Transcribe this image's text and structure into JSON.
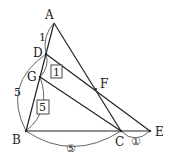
{
  "diagram": {
    "points": [
      {
        "name": "A",
        "x": 54,
        "y": 23
      },
      {
        "name": "D",
        "x": 46,
        "y": 54
      },
      {
        "name": "G",
        "x": 40,
        "y": 77
      },
      {
        "name": "B",
        "x": 26,
        "y": 131
      },
      {
        "name": "C",
        "x": 121,
        "y": 131
      },
      {
        "name": "E",
        "x": 150,
        "y": 131
      },
      {
        "name": "F",
        "x": 96,
        "y": 89
      }
    ],
    "labels": {
      "A": "A",
      "D": "D",
      "G": "G",
      "B": "B",
      "C": "C",
      "E": "E",
      "F": "F"
    },
    "ratios": {
      "AD": "1",
      "DB": "5",
      "DG_box": "1",
      "GB_box": "5",
      "BC_circled": "⑤",
      "CE_circled": "①"
    }
  }
}
